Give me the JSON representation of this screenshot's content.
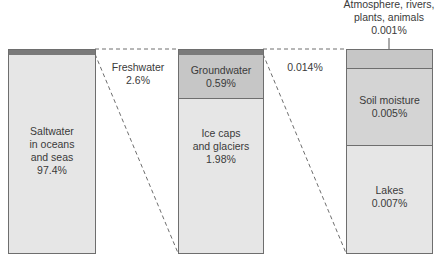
{
  "colors": {
    "strip": "#7a7a7a",
    "light": "#e6e6e6",
    "medium": "#c6c6c6",
    "border": "#6e6e6e",
    "text": "#3a3a3a"
  },
  "bars": {
    "total": {
      "segments": [
        {
          "label": "",
          "value": ""
        },
        {
          "label": "Saltwater\nin oceans\nand seas",
          "value": "97.4%"
        }
      ]
    },
    "freshwater": {
      "callout_label": "Freshwater",
      "callout_value": "2.6%",
      "segments": [
        {
          "label": "Groundwater",
          "value": "0.59%"
        },
        {
          "label": "Ice caps\nand glaciers",
          "value": "1.98%"
        }
      ]
    },
    "surface": {
      "callout_value": "0.014%",
      "top_label": "Atmosphere, rivers,\nplants, animals",
      "top_value": "0.001%",
      "segments": [
        {
          "label": "",
          "value": ""
        },
        {
          "label": "Soil moisture",
          "value": "0.005%"
        },
        {
          "label": "Lakes",
          "value": "0.007%"
        }
      ]
    }
  }
}
